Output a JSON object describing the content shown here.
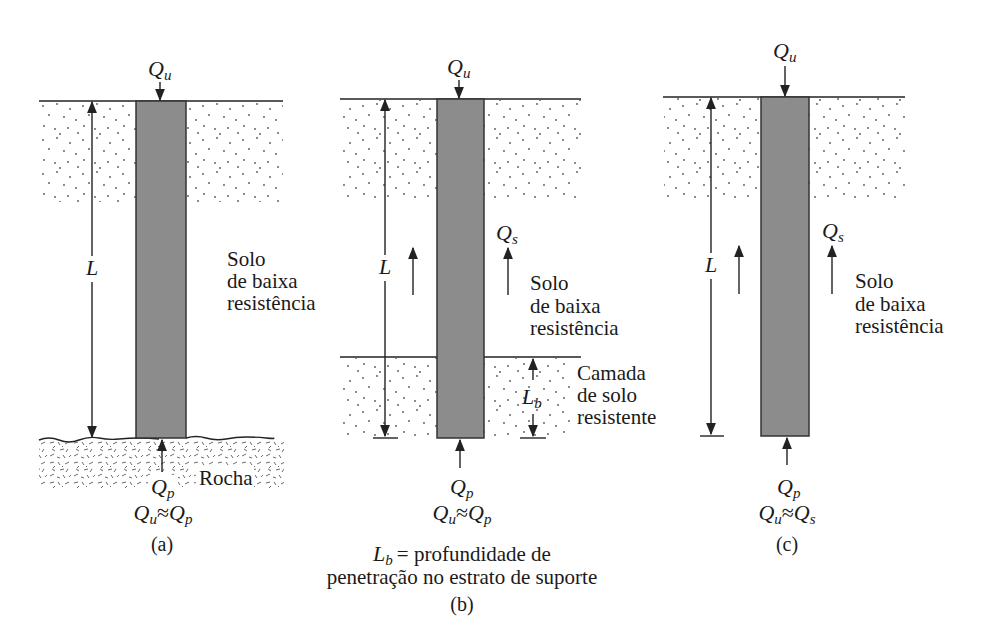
{
  "colors": {
    "pile_fill": "#8c8c8c",
    "line": "#222222",
    "background": "#ffffff"
  },
  "panels": [
    {
      "id": "a",
      "load_top": {
        "sym": "Q",
        "sub": "u"
      },
      "length_label": "L",
      "soil_label": [
        "Solo",
        "de baixa",
        "resistência"
      ],
      "base_label": "Rocha",
      "point_load": {
        "sym": "Q",
        "sub": "p"
      },
      "relation": {
        "lhs_sym": "Q",
        "lhs_sub": "u",
        "op": "≈",
        "rhs_sym": "Q",
        "rhs_sub": "p"
      },
      "caption": "(a)"
    },
    {
      "id": "b",
      "load_top": {
        "sym": "Q",
        "sub": "u"
      },
      "length_label": "L",
      "skin_load": {
        "sym": "Q",
        "sub": "s"
      },
      "soil_label": [
        "Solo",
        "de baixa",
        "resistência"
      ],
      "bearing_label": [
        "Camada",
        "de solo",
        "resistente"
      ],
      "penetration_label": {
        "sym": "L",
        "sub": "b"
      },
      "point_load": {
        "sym": "Q",
        "sub": "p"
      },
      "relation": {
        "lhs_sym": "Q",
        "lhs_sub": "u",
        "op": "≈",
        "rhs_sym": "Q",
        "rhs_sub": "p"
      },
      "definition": {
        "sym": "L",
        "sub": "b",
        "line1": "= profundidade de",
        "line2": "penetração no estrato de suporte"
      },
      "caption": "(b)"
    },
    {
      "id": "c",
      "load_top": {
        "sym": "Q",
        "sub": "u"
      },
      "length_label": "L",
      "skin_load": {
        "sym": "Q",
        "sub": "s"
      },
      "soil_label": [
        "Solo",
        "de baixa",
        "resistência"
      ],
      "point_load": {
        "sym": "Q",
        "sub": "p"
      },
      "relation": {
        "lhs_sym": "Q",
        "lhs_sub": "u",
        "op": "≈",
        "rhs_sym": "Q",
        "rhs_sub": "s"
      },
      "caption": "(c)"
    }
  ]
}
